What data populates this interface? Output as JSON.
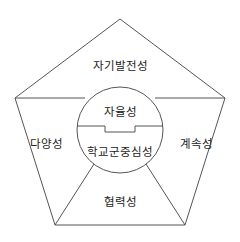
{
  "diagram": {
    "type": "pentagon-with-center-circle",
    "colors": {
      "stroke": "#555555",
      "text": "#222222",
      "background": "#ffffff"
    },
    "center": {
      "top_label": "자율성",
      "bottom_label": "학교군중심성"
    },
    "regions": {
      "top": "자기발전성",
      "left": "다양성",
      "right": "계속성",
      "bottom": "협력성"
    }
  }
}
